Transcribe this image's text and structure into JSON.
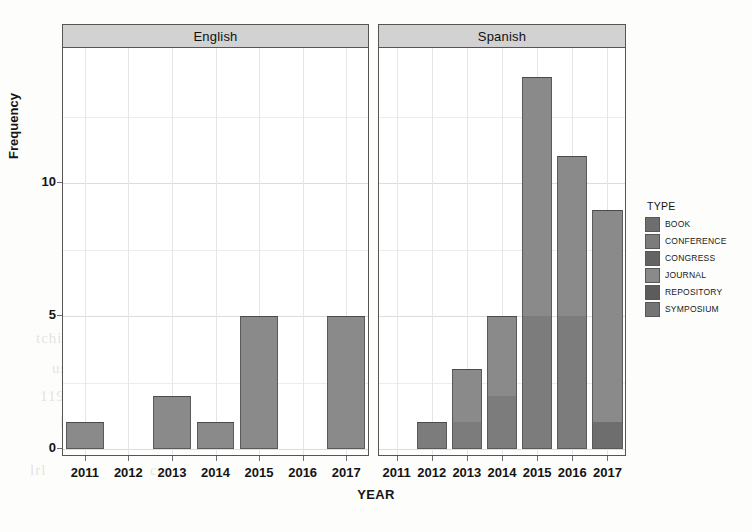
{
  "axes": {
    "y_title": "Frequency",
    "x_title": "YEAR",
    "y_ticks": [
      "0",
      "5",
      "10"
    ]
  },
  "panels": [
    {
      "label": "English"
    },
    {
      "label": "Spanish"
    }
  ],
  "legend": {
    "title": "TYPE",
    "items": [
      {
        "label": "BOOK",
        "color": "#6e6e6e"
      },
      {
        "label": "CONFERENCE",
        "color": "#7c7c7c"
      },
      {
        "label": "CONGRESS",
        "color": "#636363"
      },
      {
        "label": "JOURNAL",
        "color": "#8a8a8a"
      },
      {
        "label": "REPOSITORY",
        "color": "#5c5c5c"
      },
      {
        "label": "SYMPOSIUM",
        "color": "#747474"
      }
    ]
  },
  "bleed_text": [
    {
      "text": "tchi",
      "x": 36,
      "y": 330
    },
    {
      "text": "lo",
      "x": 120,
      "y": 330
    },
    {
      "text": "ladr",
      "x": 250,
      "y": 330
    },
    {
      "text": "use",
      "x": 52,
      "y": 360
    },
    {
      "text": "ur",
      "x": 160,
      "y": 360
    },
    {
      "text": "de",
      "x": 236,
      "y": 360
    },
    {
      "text": "roce",
      "x": 300,
      "y": 360
    },
    {
      "text": "1191",
      "x": 40,
      "y": 388
    },
    {
      "text": "CI 1",
      "x": 150,
      "y": 388
    },
    {
      "text": "pro",
      "x": 250,
      "y": 388
    },
    {
      "text": "ntem",
      "x": 320,
      "y": 388
    },
    {
      "text": "lO t",
      "x": 60,
      "y": 414
    },
    {
      "text": "ne ce",
      "x": 190,
      "y": 414
    },
    {
      "text": "lrl",
      "x": 30,
      "y": 462
    },
    {
      "text": "cn",
      "x": 150,
      "y": 462
    },
    {
      "text": "no",
      "x": 300,
      "y": 462
    },
    {
      "text": "ne",
      "x": 430,
      "y": 330
    },
    {
      "text": "el",
      "x": 560,
      "y": 362
    },
    {
      "text": "a de",
      "x": 470,
      "y": 414
    }
  ],
  "chart_data": {
    "type": "bar",
    "title": "",
    "xlabel": "YEAR",
    "ylabel": "Frequency",
    "ylim": [
      0,
      14
    ],
    "y_ticks": [
      0,
      5,
      10
    ],
    "grid": true,
    "stacked": true,
    "facets": [
      "English",
      "Spanish"
    ],
    "legend_position": "right",
    "categories": [
      "2011",
      "2012",
      "2013",
      "2014",
      "2015",
      "2016",
      "2017"
    ],
    "panels": [
      {
        "facet": "English",
        "totals": [
          1,
          0,
          2,
          1,
          5,
          0,
          5
        ],
        "series": [
          {
            "name": "BOOK",
            "values": [
              0,
              0,
              0,
              0,
              0,
              0,
              0
            ]
          },
          {
            "name": "CONFERENCE",
            "values": [
              0,
              0,
              0,
              0,
              0,
              0,
              0
            ]
          },
          {
            "name": "CONGRESS",
            "values": [
              0,
              0,
              0,
              0,
              0,
              0,
              0
            ]
          },
          {
            "name": "JOURNAL",
            "values": [
              1,
              0,
              2,
              1,
              5,
              0,
              5
            ]
          },
          {
            "name": "REPOSITORY",
            "values": [
              0,
              0,
              0,
              0,
              0,
              0,
              0
            ]
          },
          {
            "name": "SYMPOSIUM",
            "values": [
              0,
              0,
              0,
              0,
              0,
              0,
              0
            ]
          }
        ]
      },
      {
        "facet": "Spanish",
        "totals": [
          0,
          1,
          3,
          5,
          14,
          11,
          9
        ],
        "series": [
          {
            "name": "BOOK",
            "values": [
              0,
              0,
              0,
              0,
              0,
              0,
              1
            ]
          },
          {
            "name": "CONFERENCE",
            "values": [
              0,
              1,
              1,
              2,
              5,
              5,
              0
            ]
          },
          {
            "name": "CONGRESS",
            "values": [
              0,
              0,
              0,
              0,
              0,
              0,
              0
            ]
          },
          {
            "name": "JOURNAL",
            "values": [
              0,
              0,
              2,
              3,
              9,
              6,
              8
            ]
          },
          {
            "name": "REPOSITORY",
            "values": [
              0,
              0,
              0,
              0,
              0,
              0,
              0
            ]
          },
          {
            "name": "SYMPOSIUM",
            "values": [
              0,
              0,
              0,
              0,
              0,
              0,
              0
            ]
          }
        ]
      }
    ]
  }
}
